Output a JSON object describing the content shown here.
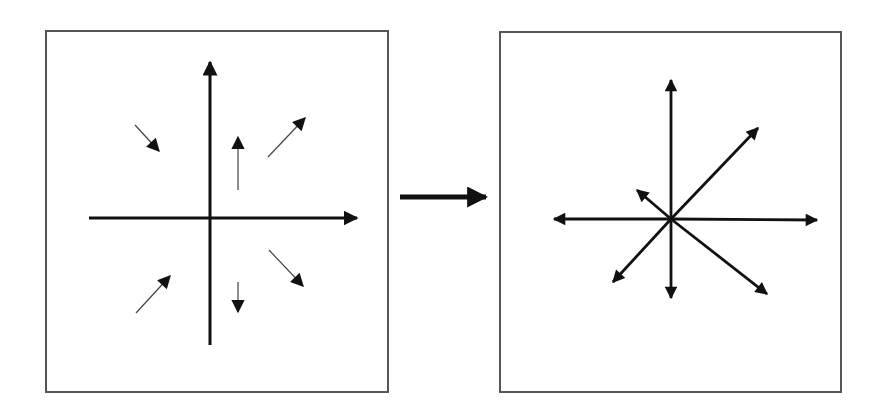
{
  "colors": {
    "background": "#ffffff",
    "panel_border": "#555555",
    "arrow": "#111111",
    "thin_arrow_shaft": "#444444"
  },
  "diagram": {
    "panels": [
      {
        "id": "before",
        "box": {
          "x": 45,
          "y": 30,
          "w": 344,
          "h": 363
        },
        "axes": {
          "origin": [
            210,
            218
          ],
          "horizontal": {
            "from": [
              89,
              218
            ],
            "to": [
              357,
              218
            ],
            "arrowhead": "right"
          },
          "vertical": {
            "from": [
              210,
              345
            ],
            "to": [
              210,
              62
            ],
            "arrowhead": "up"
          }
        },
        "field_arrows": [
          {
            "name": "top-left",
            "from": [
              135,
              125
            ],
            "to": [
              159,
              151
            ]
          },
          {
            "name": "top-center",
            "from": [
              238,
              190
            ],
            "to": [
              238,
              137
            ]
          },
          {
            "name": "top-right",
            "from": [
              268,
              157
            ],
            "to": [
              305,
              118
            ]
          },
          {
            "name": "bottom-left",
            "from": [
              136,
              313
            ],
            "to": [
              170,
              276
            ]
          },
          {
            "name": "bottom-center",
            "from": [
              238,
              282
            ],
            "to": [
              238,
              312
            ]
          },
          {
            "name": "bottom-right",
            "from": [
              269,
              250
            ],
            "to": [
              303,
              286
            ]
          }
        ]
      },
      {
        "id": "after",
        "box": {
          "x": 499,
          "y": 31,
          "w": 343,
          "h": 362
        },
        "origin": [
          671,
          219
        ],
        "rays": [
          {
            "name": "up",
            "to": [
              671,
              80
            ]
          },
          {
            "name": "up-right",
            "to": [
              758,
              128
            ]
          },
          {
            "name": "up-left-short",
            "to": [
              637,
              190
            ]
          },
          {
            "name": "left",
            "to": [
              554,
              219
            ]
          },
          {
            "name": "right",
            "to": [
              817,
              220
            ]
          },
          {
            "name": "down-left",
            "to": [
              613,
              282
            ]
          },
          {
            "name": "down",
            "to": [
              671,
              298
            ]
          },
          {
            "name": "down-right",
            "to": [
              767,
              294
            ]
          }
        ]
      }
    ],
    "transition_arrow": {
      "from": [
        400,
        197
      ],
      "to": [
        486,
        197
      ]
    }
  }
}
